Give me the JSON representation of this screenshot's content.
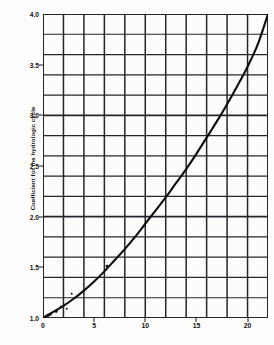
{
  "chart_data": {
    "type": "line",
    "title": "",
    "xlabel": "",
    "ylabel": "Coefficient for the hydrologic cycle",
    "xlim": [
      0,
      22
    ],
    "ylim": [
      1.0,
      4.0
    ],
    "grid": true,
    "legend_position": "none",
    "x_ticks": [
      {
        "value": 0,
        "label": "0"
      },
      {
        "value": 5,
        "label": "5"
      },
      {
        "value": 10,
        "label": "10"
      },
      {
        "value": 15,
        "label": "15"
      },
      {
        "value": 20,
        "label": "20"
      }
    ],
    "y_ticks": [
      {
        "value": 1.0,
        "label": "1.0"
      },
      {
        "value": 1.5,
        "label": "1.5"
      },
      {
        "value": 2.0,
        "label": "2.0"
      },
      {
        "value": 2.5,
        "label": "2.5"
      },
      {
        "value": 3.0,
        "label": "3.0"
      },
      {
        "value": 3.5,
        "label": "3.5"
      },
      {
        "value": 4.0,
        "label": "4.0"
      }
    ],
    "x_gridlines": [
      0,
      2,
      4,
      6,
      8,
      10,
      12,
      14,
      16,
      18,
      20,
      22
    ],
    "y_gridlines": [
      1.0,
      1.2,
      1.4,
      1.6,
      1.8,
      2.0,
      2.2,
      2.4,
      2.6,
      2.8,
      3.0,
      3.2,
      3.4,
      3.6,
      3.8,
      4.0
    ],
    "series": [
      {
        "name": "fitted curve",
        "kind": "line",
        "x": [
          0,
          1,
          2,
          3,
          4,
          5,
          6,
          7,
          8,
          9,
          10,
          11,
          12,
          13,
          14,
          15,
          16,
          17,
          18,
          19,
          20,
          21,
          22
        ],
        "values": [
          1.0,
          1.06,
          1.12,
          1.19,
          1.27,
          1.36,
          1.46,
          1.57,
          1.68,
          1.8,
          1.93,
          2.06,
          2.19,
          2.33,
          2.47,
          2.62,
          2.78,
          2.94,
          3.11,
          3.29,
          3.48,
          3.7,
          4.0
        ]
      },
      {
        "name": "measured points",
        "kind": "scatter",
        "x": [
          0.3,
          0.5,
          0.7,
          1.3,
          1.8,
          2.3,
          2.8,
          6.3
        ],
        "values": [
          1.02,
          1.03,
          1.04,
          1.07,
          1.11,
          1.09,
          1.24,
          1.51
        ]
      }
    ]
  }
}
